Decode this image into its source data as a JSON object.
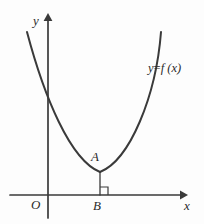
{
  "figure": {
    "background_color": "#fdfdfd",
    "stroke_color": "#3a3a3a",
    "labels": {
      "y_axis": "y",
      "x_axis": "x",
      "origin": "O",
      "vertex_point": "A",
      "foot_point": "B",
      "curve_lhs": "y",
      "curve_equals": "=",
      "curve_rhs": "f (x)",
      "curve_full": "y = f (x)"
    },
    "axes": {
      "x_axis": {
        "x1": 10,
        "y1": 195,
        "x2": 186,
        "y2": 195,
        "arrow": "right"
      },
      "y_axis": {
        "x1": 48,
        "y1": 218,
        "x2": 48,
        "y2": 15,
        "arrow": "up"
      }
    },
    "curve": {
      "type": "parabola",
      "opens": "up",
      "vertex": {
        "x": 100,
        "y": 172
      },
      "left_endpoint": {
        "x": 27,
        "y": 32
      },
      "right_endpoint": {
        "x": 161,
        "y": 32
      },
      "y_intercept": {
        "x": 48,
        "y": 98
      },
      "path": "M 27 32 C 44 96, 70 160, 100 172 C 130 160, 150 96, 161 32"
    },
    "perpendicular_segment": {
      "from": "A",
      "to": "B",
      "x": 100,
      "y_top": 173,
      "y_bottom": 195
    },
    "right_angle_mark": {
      "at": "B",
      "side": "right",
      "size": 8
    }
  }
}
